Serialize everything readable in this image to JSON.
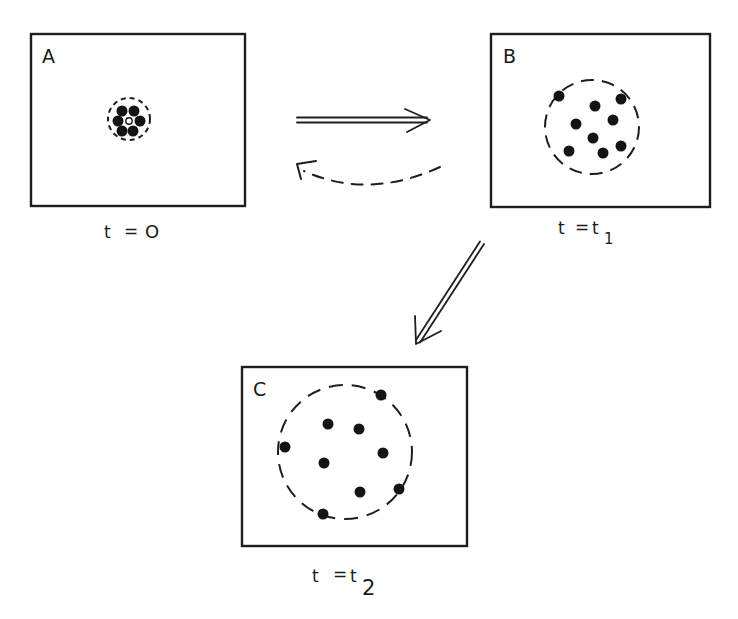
{
  "diagram": {
    "type": "diffusion-time-sequence",
    "colors": {
      "ink": "#1e1e1e",
      "background": "#ffffff",
      "particle": "#141414"
    },
    "panels": [
      {
        "id": "A",
        "letter": "A",
        "time_label": {
          "prefix": "t = ",
          "main": "O",
          "subscript": ""
        },
        "frame": {
          "x": 31,
          "y": 34,
          "w": 214,
          "h": 172
        },
        "cloud": {
          "cx": 129,
          "cy": 119,
          "r": 21,
          "dash": "5 4"
        },
        "particles": [
          {
            "x": 122,
            "y": 111,
            "r": 5.5
          },
          {
            "x": 134,
            "y": 111,
            "r": 5.5
          },
          {
            "x": 118,
            "y": 121,
            "r": 5.5
          },
          {
            "x": 140,
            "y": 121,
            "r": 5.5
          },
          {
            "x": 122,
            "y": 131,
            "r": 5.5
          },
          {
            "x": 133,
            "y": 131,
            "r": 5.5
          }
        ],
        "center_marker": {
          "x": 129,
          "y": 121,
          "r": 3
        }
      },
      {
        "id": "B",
        "letter": "B",
        "time_label": {
          "prefix": "t = t",
          "main": "",
          "subscript": "1"
        },
        "frame": {
          "x": 491,
          "y": 34,
          "w": 219,
          "h": 173
        },
        "cloud": {
          "cx": 592,
          "cy": 127,
          "r": 47,
          "dash": "13 8"
        },
        "particles": [
          {
            "x": 559,
            "y": 96,
            "r": 5.5
          },
          {
            "x": 595,
            "y": 106,
            "r": 5.5
          },
          {
            "x": 621,
            "y": 99,
            "r": 5.5
          },
          {
            "x": 576,
            "y": 124,
            "r": 5.5
          },
          {
            "x": 613,
            "y": 120,
            "r": 5.5
          },
          {
            "x": 593,
            "y": 138,
            "r": 5.5
          },
          {
            "x": 569,
            "y": 151,
            "r": 5.5
          },
          {
            "x": 603,
            "y": 153,
            "r": 5.5
          },
          {
            "x": 621,
            "y": 146,
            "r": 5.5
          }
        ]
      },
      {
        "id": "C",
        "letter": "C",
        "time_label": {
          "prefix": "t = t",
          "main": "",
          "subscript": "2"
        },
        "frame": {
          "x": 242,
          "y": 367,
          "w": 225,
          "h": 179
        },
        "cloud": {
          "cx": 345,
          "cy": 452,
          "r": 67,
          "dash": "14 9"
        },
        "particles": [
          {
            "x": 381,
            "y": 395,
            "r": 5.5
          },
          {
            "x": 328,
            "y": 424,
            "r": 5.5
          },
          {
            "x": 359,
            "y": 429,
            "r": 5.5
          },
          {
            "x": 285,
            "y": 447,
            "r": 5.5
          },
          {
            "x": 383,
            "y": 453,
            "r": 5.5
          },
          {
            "x": 324,
            "y": 463,
            "r": 5.5
          },
          {
            "x": 360,
            "y": 492,
            "r": 5.5
          },
          {
            "x": 399,
            "y": 489,
            "r": 5.5
          },
          {
            "x": 323,
            "y": 514,
            "r": 5.5
          }
        ]
      }
    ],
    "labels": {
      "A": {
        "letter": "A",
        "t": "t",
        "eq": "=",
        "value": "O"
      },
      "B": {
        "letter": "B",
        "t": "t",
        "eq": "=",
        "value": "t",
        "sub": "1"
      },
      "C": {
        "letter": "C",
        "t": "t",
        "eq": "=",
        "value": "t",
        "sub": "2"
      }
    },
    "arrows": [
      {
        "id": "forward-A-to-B",
        "style": "double-solid",
        "from": [
          297,
          120
        ],
        "to": [
          430,
          120
        ]
      },
      {
        "id": "reverse-B-to-A",
        "style": "dashed-curved",
        "from": [
          440,
          167
        ],
        "to": [
          296,
          165
        ]
      },
      {
        "id": "forward-B-to-C",
        "style": "double-solid",
        "from": [
          482,
          243
        ],
        "to": [
          416,
          344
        ]
      }
    ]
  }
}
